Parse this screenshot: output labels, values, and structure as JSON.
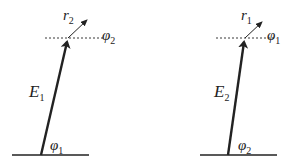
{
  "diagram": {
    "panels": [
      {
        "id": "left",
        "main_vector": {
          "symbol": "E",
          "subscript": "1"
        },
        "small_vector": {
          "symbol": "r",
          "subscript": "2"
        },
        "top_angle": {
          "symbol": "φ",
          "subscript": "2"
        },
        "bottom_angle": {
          "symbol": "φ",
          "subscript": "1"
        }
      },
      {
        "id": "right",
        "main_vector": {
          "symbol": "E",
          "subscript": "2"
        },
        "small_vector": {
          "symbol": "r",
          "subscript": "1"
        },
        "top_angle": {
          "symbol": "φ",
          "subscript": "1"
        },
        "bottom_angle": {
          "symbol": "φ",
          "subscript": "2"
        }
      }
    ],
    "colors": {
      "stroke": "#222222",
      "background": "#ffffff"
    }
  }
}
